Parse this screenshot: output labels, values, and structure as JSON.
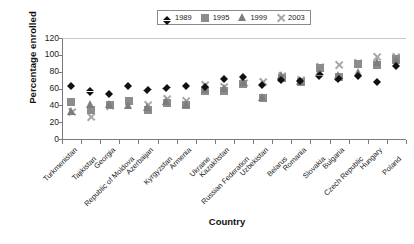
{
  "chart_data": {
    "type": "scatter",
    "title": "",
    "xlabel": "Country",
    "ylabel": "Percentage enrolled",
    "ylim": [
      0,
      120
    ],
    "ytick_step": 20,
    "yticks": [
      0,
      20,
      40,
      60,
      80,
      100,
      120
    ],
    "grid": false,
    "legend_position": "top-center",
    "categories": [
      "Turkmenistan",
      "Tajikistan",
      "Georgia",
      "Republic of Moldova",
      "Azerbaijan",
      "Kyrgyzstan",
      "Armenia",
      "Ukraine",
      "Kazakhstan",
      "Russian Federation",
      "Uzbekistan",
      "Belarus",
      "Romania",
      "Slovakia",
      "Bulgaria",
      "Czech Republic",
      "Hungary",
      "Poland"
    ],
    "series": [
      {
        "name": "1989",
        "marker": "diamond",
        "color": "#111111",
        "values": [
          67,
          60,
          57,
          67,
          62,
          64,
          67,
          65,
          75,
          77,
          68,
          74,
          72,
          79,
          75,
          78,
          71,
          90
        ]
      },
      {
        "name": "1995",
        "marker": "square",
        "color": "#8c8c8c",
        "values": [
          44,
          34,
          41,
          45,
          35,
          43,
          41,
          57,
          57,
          66,
          49,
          72,
          68,
          84,
          74,
          89,
          88,
          95
        ]
      },
      {
        "name": "1999",
        "marker": "triangle",
        "color": "#7d7d7d",
        "values": [
          33,
          41,
          42,
          40,
          38,
          45,
          42,
          59,
          61,
          68,
          50,
          76,
          69,
          79,
          76,
          79,
          91,
          94
        ]
      },
      {
        "name": "2003",
        "marker": "x",
        "color": "#a6a6a6",
        "values": [
          32,
          26,
          39,
          45,
          40,
          47,
          45,
          64,
          62,
          67,
          68,
          75,
          70,
          85,
          88,
          90,
          97,
          98
        ]
      }
    ]
  },
  "legend": {
    "entries": [
      {
        "label": "1989",
        "marker": "diamond-marker"
      },
      {
        "label": "1995",
        "marker": "square-marker"
      },
      {
        "label": "1999",
        "marker": "triangle-marker"
      },
      {
        "label": "2003",
        "marker": "x-marker"
      }
    ]
  },
  "axes": {
    "y_title": "Percentage enrolled",
    "x_title": "Country",
    "y_tick_labels": [
      "120",
      "100",
      "80",
      "60",
      "40",
      "20",
      "0"
    ]
  }
}
